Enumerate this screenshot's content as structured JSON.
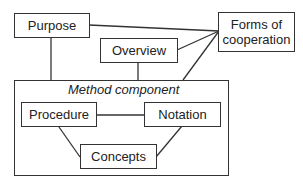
{
  "diagram": {
    "nodes": {
      "purpose": "Purpose",
      "overview": "Overview",
      "forms_of_cooperation": "Forms of\ncooperation",
      "method_component": "Method component",
      "procedure": "Procedure",
      "notation": "Notation",
      "concepts": "Concepts"
    },
    "edges": [
      [
        "Purpose",
        "Forms of cooperation"
      ],
      [
        "Overview",
        "Forms of cooperation"
      ],
      [
        "Method component",
        "Forms of cooperation"
      ],
      [
        "Purpose",
        "Method component"
      ],
      [
        "Overview",
        "Method component"
      ],
      [
        "Procedure",
        "Notation"
      ],
      [
        "Procedure",
        "Concepts"
      ],
      [
        "Notation",
        "Concepts"
      ]
    ],
    "line_color": "#333333"
  }
}
